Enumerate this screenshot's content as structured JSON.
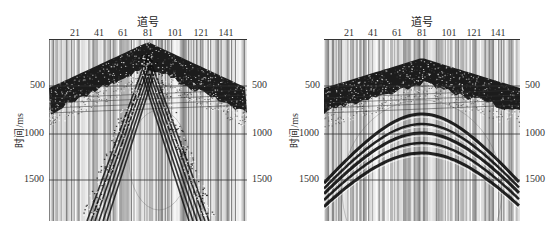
{
  "figure": {
    "panels": [
      {
        "id": "left",
        "x_axis_title": "道号",
        "y_axis_title": "时间/ms",
        "x_ticks": [
          "21",
          "41",
          "61",
          "81",
          "101",
          "121",
          "141"
        ],
        "y_ticks": [
          "500",
          "1000",
          "1500"
        ],
        "pattern": "linear-crossing"
      },
      {
        "id": "right",
        "x_axis_title": "道号",
        "y_axis_title": "时间/ms",
        "x_ticks": [
          "21",
          "41",
          "61",
          "81",
          "101",
          "121",
          "141"
        ],
        "y_ticks": [
          "500",
          "1000",
          "1500"
        ],
        "pattern": "hyperbolic"
      }
    ],
    "colors": {
      "trace_dark": "#1a1a1a",
      "trace_light": "#d8d8d8",
      "background": "#ffffff",
      "gridline": "#333333"
    }
  }
}
